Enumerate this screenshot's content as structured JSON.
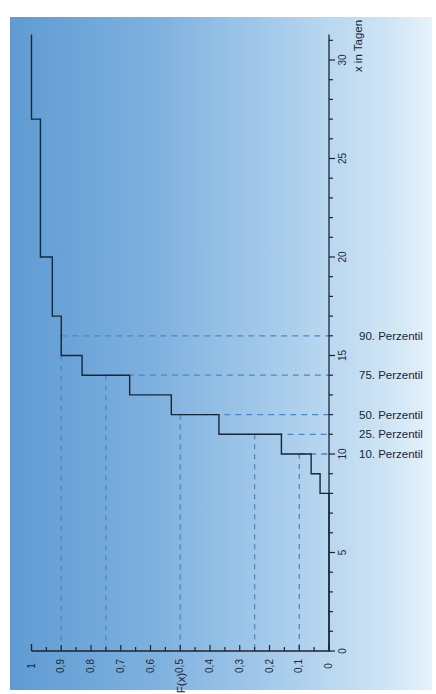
{
  "chart_data": {
    "type": "line",
    "subtype": "empirical-cdf-step",
    "orientation": "rotated-90-clockwise",
    "title": "",
    "xlabel": "x in Tagen",
    "ylabel": "F(x)",
    "xlim": [
      0,
      31
    ],
    "ylim": [
      0,
      1
    ],
    "x_ticks": [
      0,
      5,
      10,
      15,
      20,
      25,
      30
    ],
    "x_minor_step": 1,
    "y_ticks": [
      "0",
      "0,1",
      "0,2",
      "0,3",
      "0,4",
      "0,5",
      "0,6",
      "0,7",
      "0,8",
      "0,9",
      "1"
    ],
    "y_tick_values": [
      0,
      0.1,
      0.2,
      0.3,
      0.4,
      0.5,
      0.6,
      0.7,
      0.8,
      0.9,
      1.0
    ],
    "y_minor_step": 0.05,
    "grid": false,
    "series": [
      {
        "name": "F(x)",
        "steps": [
          {
            "x": 8,
            "F": 0.03
          },
          {
            "x": 9,
            "F": 0.06
          },
          {
            "x": 10,
            "F": 0.16
          },
          {
            "x": 11,
            "F": 0.37
          },
          {
            "x": 12,
            "F": 0.53
          },
          {
            "x": 13,
            "F": 0.67
          },
          {
            "x": 14,
            "F": 0.83
          },
          {
            "x": 15,
            "F": 0.9
          },
          {
            "x": 17,
            "F": 0.93
          },
          {
            "x": 20,
            "F": 0.97
          },
          {
            "x": 27,
            "F": 1.0
          }
        ],
        "x_end": 31.3
      }
    ],
    "percentiles": [
      {
        "label": "10. Perzentil",
        "F": 0.1,
        "x": 10
      },
      {
        "label": "25. Perzentil",
        "F": 0.25,
        "x": 11
      },
      {
        "label": "50. Perzentil",
        "F": 0.5,
        "x": 12
      },
      {
        "label": "75. Perzentil",
        "F": 0.75,
        "x": 14
      },
      {
        "label": "90. Perzentil",
        "F": 0.9,
        "x": 16
      }
    ]
  },
  "colors": {
    "line": "#16273a",
    "axis": "#1b2530",
    "dashed": "#4d86c6"
  }
}
